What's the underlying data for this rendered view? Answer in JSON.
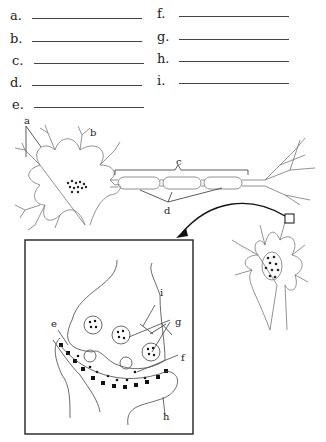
{
  "answer_blanks": [
    {
      "letter": "a.",
      "x": 10,
      "y": 8
    },
    {
      "letter": "b.",
      "x": 10,
      "y": 31
    },
    {
      "letter": "c.",
      "x": 12,
      "y": 53
    },
    {
      "letter": "d.",
      "x": 10,
      "y": 75
    },
    {
      "letter": "e.",
      "x": 12,
      "y": 97
    },
    {
      "letter": "f.",
      "x": 157,
      "y": 6
    },
    {
      "letter": "g.",
      "x": 157,
      "y": 29
    },
    {
      "letter": "h.",
      "x": 157,
      "y": 51
    },
    {
      "letter": "i.",
      "x": 157,
      "y": 73
    }
  ],
  "diagram_labels": {
    "a": "a",
    "b": "b",
    "c": "c",
    "d": "d",
    "e": "e",
    "f": "f",
    "g": "g",
    "h": "h",
    "i": "i"
  }
}
